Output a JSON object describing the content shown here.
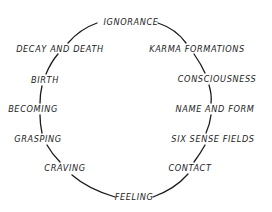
{
  "diagram": {
    "type": "cycle",
    "title": "",
    "direction": "clockwise",
    "colors": {
      "line": "#1a1a1a",
      "text": "#222222",
      "background": "#ffffff"
    },
    "nodes": [
      {
        "id": "ignorance",
        "label": "IGNORANCE",
        "x": 131,
        "y": 22
      },
      {
        "id": "karma-formations",
        "label": "KARMA FORMATIONS",
        "x": 197,
        "y": 49
      },
      {
        "id": "consciousness",
        "label": "CONSCIOUSNESS",
        "x": 217,
        "y": 79
      },
      {
        "id": "name-and-form",
        "label": "NAME AND FORM",
        "x": 215,
        "y": 109
      },
      {
        "id": "six-sense-fields",
        "label": "SIX SENSE FIELDS",
        "x": 213,
        "y": 139
      },
      {
        "id": "contact",
        "label": "CONTACT",
        "x": 190,
        "y": 168
      },
      {
        "id": "feeling",
        "label": "FEELING",
        "x": 134,
        "y": 197
      },
      {
        "id": "craving",
        "label": "CRAVING",
        "x": 65,
        "y": 168
      },
      {
        "id": "grasping",
        "label": "GRASPING",
        "x": 38,
        "y": 139
      },
      {
        "id": "becoming",
        "label": "BECOMING",
        "x": 33,
        "y": 109
      },
      {
        "id": "birth",
        "label": "BIRTH",
        "x": 45,
        "y": 80
      },
      {
        "id": "decay-and-death",
        "label": "DECAY AND DEATH",
        "x": 60,
        "y": 49
      }
    ],
    "edges": [
      {
        "from": "ignorance",
        "to": "karma-formations"
      },
      {
        "from": "karma-formations",
        "to": "consciousness"
      },
      {
        "from": "consciousness",
        "to": "name-and-form"
      },
      {
        "from": "name-and-form",
        "to": "six-sense-fields"
      },
      {
        "from": "six-sense-fields",
        "to": "contact"
      },
      {
        "from": "contact",
        "to": "feeling"
      },
      {
        "from": "feeling",
        "to": "craving"
      },
      {
        "from": "craving",
        "to": "grasping"
      },
      {
        "from": "grasping",
        "to": "becoming"
      },
      {
        "from": "becoming",
        "to": "birth"
      },
      {
        "from": "birth",
        "to": "decay-and-death"
      },
      {
        "from": "decay-and-death",
        "to": "ignorance"
      }
    ]
  }
}
